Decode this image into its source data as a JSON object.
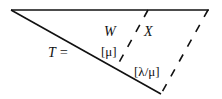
{
  "diagram": {
    "type": "triangle-partition",
    "labels": {
      "T": "T =",
      "W": "W",
      "X": "X",
      "mu": "[μ]",
      "lambda_mu": "[λ/μ]"
    },
    "colors": {
      "line": "#111111",
      "background": "#ffffff"
    }
  }
}
